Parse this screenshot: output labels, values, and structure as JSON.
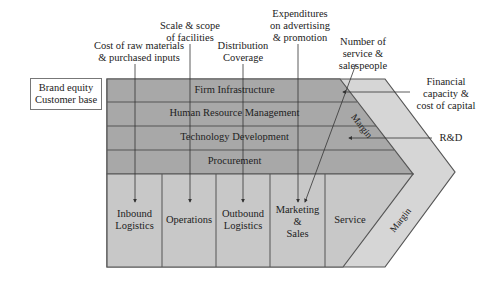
{
  "diagram": {
    "colors": {
      "support_fill": "#a8a8a8",
      "primary_fill": "#c8c8c8",
      "margin_fill": "#d6d6d6",
      "line": "#555555"
    },
    "support_activities": [
      {
        "label": "Firm Infrastructure"
      },
      {
        "label": "Human Resource Management"
      },
      {
        "label": "Technology Development"
      },
      {
        "label": "Procurement"
      }
    ],
    "primary_activities": [
      {
        "label_line1": "Inbound",
        "label_line2": "Logistics",
        "label_line3": ""
      },
      {
        "label_line1": "Operations",
        "label_line2": "",
        "label_line3": ""
      },
      {
        "label_line1": "Outbound",
        "label_line2": "Logistics",
        "label_line3": ""
      },
      {
        "label_line1": "Marketing",
        "label_line2": "&",
        "label_line3": "Sales"
      },
      {
        "label_line1": "Service",
        "label_line2": "",
        "label_line3": ""
      }
    ],
    "margin_labels": [
      "Margin",
      "Margin"
    ],
    "side_box": {
      "line1": "Brand equity",
      "line2": "Customer base"
    },
    "annotations": [
      {
        "id": "raw-materials",
        "line1": "Cost of raw materials",
        "line2": "& purchased inputs",
        "line3": ""
      },
      {
        "id": "scale-scope",
        "line1": "Scale & scope",
        "line2": "of facilities",
        "line3": ""
      },
      {
        "id": "distribution",
        "line1": "Distribution",
        "line2": "Coverage",
        "line3": ""
      },
      {
        "id": "advertising",
        "line1": "Expenditures",
        "line2": "on advertising",
        "line3": "& promotion"
      },
      {
        "id": "service-sales",
        "line1": "Number of",
        "line2": "service &",
        "line3": "salespeople"
      },
      {
        "id": "financial",
        "line1": "Financial",
        "line2": "capacity &",
        "line3": "cost of capital"
      },
      {
        "id": "rnd",
        "line1": "R&D",
        "line2": "",
        "line3": ""
      }
    ]
  }
}
